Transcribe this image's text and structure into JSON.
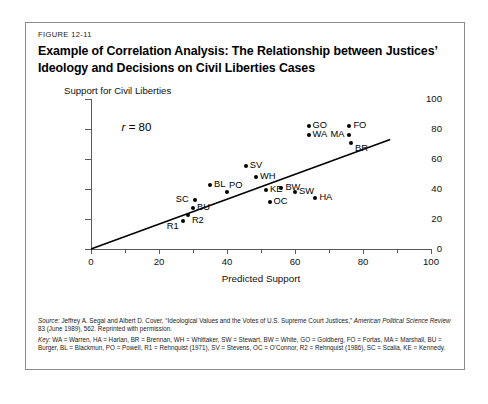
{
  "figure": {
    "label": "FIGURE 12-11",
    "title": "Example of Correlation Analysis: The Relationship between Justices’ Ideology and Decisions on Civil Liberties Cases"
  },
  "annotation": {
    "r_symbol": "r",
    "r_text": " = 80"
  },
  "source": {
    "prefix": "Source:",
    "body_1": " Jeffrey A. Segal and Albert D. Cover, “Ideological Values and the Votes of U.S. Supreme Court Justices,” ",
    "journal": "American Political Science Review",
    "body_2": " 83 (June 1989), 562. Reprinted with permission."
  },
  "key": {
    "prefix": "Key:",
    "text": " WA = Warren, HA = Harlan, BR = Brennan, WH = Whittaker, SW = Stewart, BW = White, GO = Goldberg, FO = Fortas, MA = Marshall, BU = Burger, BL = Blackmun, PO = Powell, R1 = Rehnquist (1971), SV = Stevens, OC = O’Connor, R2 = Rehnquist (1986), SC = Scalia, KE = Kennedy."
  },
  "chart_data": {
    "type": "scatter",
    "title": "Example of Correlation Analysis: The Relationship between Justices’ Ideology and Decisions on Civil Liberties Cases",
    "xlabel": "Predicted Support",
    "ylabel": "Support for Civil Liberties",
    "xlim": [
      0,
      100
    ],
    "ylim": [
      0,
      100
    ],
    "xticks": [
      0,
      20,
      40,
      60,
      80,
      100
    ],
    "xtick_labels": [
      "0",
      "20",
      "40",
      "60",
      "80",
      "100"
    ],
    "xminor_ticks": [
      10,
      30,
      50,
      70,
      90
    ],
    "yticks": [
      0,
      20,
      40,
      60,
      80,
      100
    ],
    "ytick_labels": [
      "0",
      "20",
      "40",
      "60",
      "80",
      "100"
    ],
    "grid": false,
    "legend": "none",
    "correlation_r": 80,
    "annotation_text": "r = 80",
    "trendline": {
      "type": "linear",
      "x_start": 0,
      "y_start": 0,
      "x_end": 88,
      "y_end": 73
    },
    "points": [
      {
        "label": "R1",
        "x": 27,
        "y": 19,
        "label_pos": "below-left"
      },
      {
        "label": "R2",
        "x": 28.5,
        "y": 23,
        "label_pos": "below-right"
      },
      {
        "label": "BU",
        "x": 30,
        "y": 27.5,
        "label_pos": "right"
      },
      {
        "label": "SC",
        "x": 30.5,
        "y": 33,
        "label_pos": "left"
      },
      {
        "label": "BL",
        "x": 35,
        "y": 43,
        "label_pos": "right"
      },
      {
        "label": "PO",
        "x": 40,
        "y": 38,
        "label_pos": "above-right"
      },
      {
        "label": "SV",
        "x": 45.5,
        "y": 55.5,
        "label_pos": "right"
      },
      {
        "label": "WH",
        "x": 48.5,
        "y": 48,
        "label_pos": "right"
      },
      {
        "label": "KE",
        "x": 51.5,
        "y": 39.5,
        "label_pos": "right"
      },
      {
        "label": "OC",
        "x": 52.5,
        "y": 31.5,
        "label_pos": "right"
      },
      {
        "label": "BW",
        "x": 56,
        "y": 41,
        "label_pos": "right"
      },
      {
        "label": "SW",
        "x": 60,
        "y": 38,
        "label_pos": "right"
      },
      {
        "label": "GO",
        "x": 64,
        "y": 82,
        "label_pos": "right"
      },
      {
        "label": "WA",
        "x": 64,
        "y": 76,
        "label_pos": "right"
      },
      {
        "label": "HA",
        "x": 66,
        "y": 34,
        "label_pos": "right"
      },
      {
        "label": "FO",
        "x": 76,
        "y": 82,
        "label_pos": "right"
      },
      {
        "label": "MA",
        "x": 76,
        "y": 76,
        "label_pos": "left"
      },
      {
        "label": "BR",
        "x": 76.5,
        "y": 71,
        "label_pos": "below-right"
      }
    ]
  }
}
